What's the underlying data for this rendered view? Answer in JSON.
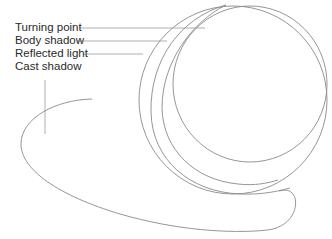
{
  "diagram": {
    "labels": [
      {
        "id": "turning-point",
        "text": "Turning point"
      },
      {
        "id": "body-shadow",
        "text": "Body shadow"
      },
      {
        "id": "reflected-light",
        "text": "Reflected light"
      },
      {
        "id": "cast-shadow",
        "text": "Cast shadow"
      }
    ],
    "colors": {
      "background": "#ffffff",
      "line": "#8a8a8a",
      "text": "#2a2a2a"
    }
  }
}
